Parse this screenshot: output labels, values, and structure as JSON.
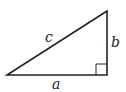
{
  "diagram": {
    "type": "right-triangle",
    "labels": {
      "hypotenuse": "c",
      "vertical_leg": "b",
      "horizontal_leg": "a"
    },
    "right_angle_marker": true,
    "colors": {
      "stroke": "#222222",
      "background": "#ffffff"
    }
  }
}
